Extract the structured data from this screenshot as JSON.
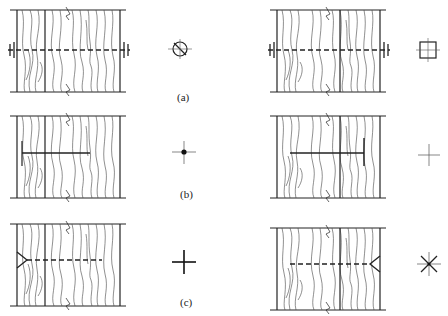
{
  "diagram": {
    "type": "technical-drawing",
    "rows": [
      {
        "label": "(a)",
        "left_symbol": "circle-with-slash",
        "right_symbol": "square-with-cross",
        "left_marker": "bolt-both-sides",
        "right_marker": "bolt-both-sides"
      },
      {
        "label": "(b)",
        "left_symbol": "dot-cross",
        "right_symbol": "plain-cross",
        "left_marker": "nail-from-left",
        "right_marker": "nail-from-right"
      },
      {
        "label": "(c)",
        "left_symbol": "bold-cross",
        "right_symbol": "asterisk",
        "left_marker": "screw-from-left",
        "right_marker": "screw-from-right"
      }
    ]
  },
  "labels": {
    "a": "(a)",
    "b": "(b)",
    "c": "(c)"
  },
  "colors": {
    "line": "#222222",
    "grain": "#444444",
    "background": "#ffffff"
  }
}
